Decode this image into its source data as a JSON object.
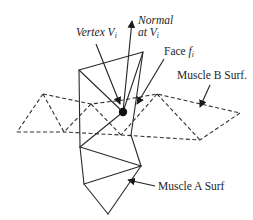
{
  "figure": {
    "labels": {
      "normal_line1": "Normal",
      "normal_line2_prefix": "at ",
      "normal_var": "V",
      "normal_sub": "i",
      "vertex_prefix": "Vertex ",
      "vertex_var": "V",
      "vertex_sub": "i",
      "face_prefix": "Face ",
      "face_var": "f",
      "face_sub": "i",
      "muscle_b": "Muscle B Surf.",
      "muscle_a": "Muscle A Surf"
    },
    "colors": {
      "line": "#2a2a2a",
      "background": "#ffffff"
    }
  }
}
